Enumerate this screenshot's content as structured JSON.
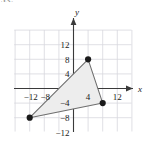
{
  "figure": {
    "corner_label": "53.",
    "background_color": "#ffffff",
    "grid_color": "#d8d8de",
    "axis_color": "#3a3a3a",
    "shape_stroke_color": "#6e6e6e",
    "shape_fill_color": "#ededed",
    "vertex_color": "#1a1a1a"
  },
  "chart_data": {
    "type": "scatter",
    "title": "",
    "xlabel": "x",
    "ylabel": "y",
    "xlim": [
      -16,
      16
    ],
    "ylim": [
      -16,
      16
    ],
    "grid": true,
    "grid_step": 4,
    "legend": "none",
    "x_tick_labels": [
      "−12",
      "−8",
      "4",
      "12"
    ],
    "x_tick_values": [
      -12,
      -8,
      4,
      12
    ],
    "y_tick_labels": [
      "12",
      "8",
      "4",
      "−4",
      "−8",
      "−12"
    ],
    "y_tick_values": [
      12,
      8,
      4,
      -4,
      -8,
      -12
    ],
    "series": [
      {
        "name": "triangle vertices",
        "points": [
          {
            "x": 4,
            "y": 8
          },
          {
            "x": 8,
            "y": -4
          },
          {
            "x": -12,
            "y": -8
          }
        ]
      }
    ],
    "annotations": [
      {
        "type": "polygon",
        "label": "shaded triangle",
        "points": [
          {
            "x": 4,
            "y": 8
          },
          {
            "x": 8,
            "y": -4
          },
          {
            "x": -12,
            "y": -8
          }
        ],
        "filled": true
      }
    ]
  }
}
